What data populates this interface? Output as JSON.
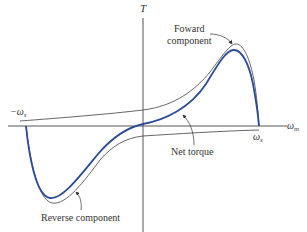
{
  "diagram": {
    "axes": {
      "y_label": "T",
      "x_label": "ω",
      "x_label_sub": "m",
      "neg_sync_label": "−ω",
      "neg_sync_sub": "s",
      "pos_sync_label": "ω",
      "pos_sync_sub": "s"
    },
    "annotations": {
      "forward_line1": "Foward",
      "forward_line2": "component",
      "net": "Net torque",
      "reverse": "Reverse component"
    },
    "colors": {
      "net_curve": "#2b4a9a",
      "component_curves": "#555555",
      "axes": "#444444",
      "text": "#333333"
    }
  }
}
